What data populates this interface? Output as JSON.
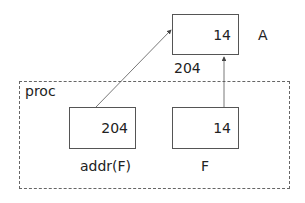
{
  "diagram": {
    "outer_region": {
      "label": "proc"
    },
    "boxes": {
      "A": {
        "value": "14",
        "name": "A",
        "address": "204"
      },
      "addr_F": {
        "value": "204",
        "name": "addr(F)"
      },
      "F": {
        "value": "14",
        "name": "F"
      }
    },
    "arrows": [
      {
        "from": "addr(F)",
        "to": "A"
      },
      {
        "from": "F",
        "to": "A"
      }
    ]
  }
}
